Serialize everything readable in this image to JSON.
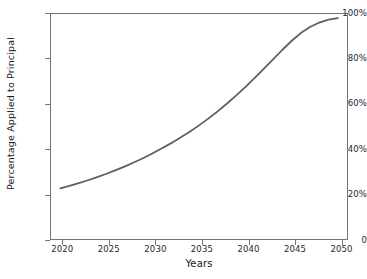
{
  "chart_data": {
    "type": "line",
    "title": "",
    "subtitle": "",
    "xlabel": "Years",
    "ylabel": "Percentage Applied to Principal",
    "xlim": [
      2019,
      2051
    ],
    "ylim": [
      0,
      100
    ],
    "xticks": [
      "2020",
      "2025",
      "2030",
      "2035",
      "2040",
      "2045",
      "2050"
    ],
    "xtick_values": [
      2020,
      2025,
      2030,
      2035,
      2040,
      2045,
      2050
    ],
    "yticks": [
      "0",
      "20%",
      "40%",
      "60%",
      "80%",
      "100%"
    ],
    "ytick_values": [
      0,
      20,
      40,
      60,
      80,
      100
    ],
    "grid": false,
    "legend": null,
    "line_color": "#5a6068",
    "line_width": 1.8,
    "series": [
      {
        "name": "Percentage Applied to Principal",
        "x": [
          2020,
          2021,
          2022,
          2023,
          2024,
          2025,
          2026,
          2027,
          2028,
          2029,
          2030,
          2031,
          2032,
          2033,
          2034,
          2035,
          2036,
          2037,
          2038,
          2039,
          2040,
          2041,
          2042,
          2043,
          2044,
          2045,
          2046,
          2047,
          2048,
          2049,
          2050
        ],
        "values": [
          22.5,
          23.6,
          24.8,
          26.1,
          27.5,
          29.0,
          30.6,
          32.3,
          34.1,
          36.0,
          38.1,
          40.3,
          42.6,
          45.1,
          47.7,
          50.5,
          53.5,
          56.7,
          60.1,
          63.7,
          67.5,
          71.5,
          75.6,
          79.8,
          84.0,
          88.0,
          91.5,
          94.2,
          96.2,
          97.5,
          98.2
        ]
      }
    ],
    "annotations": []
  },
  "axes": {
    "x_axis_name": "years-axis",
    "y_axis_name": "percentage-axis"
  }
}
